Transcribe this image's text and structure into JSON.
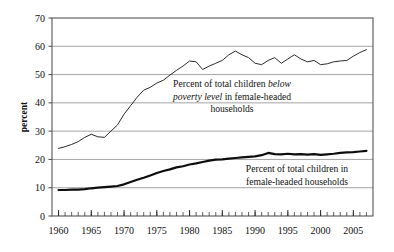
{
  "chart_data": {
    "type": "line",
    "title": "",
    "xlabel": "",
    "ylabel": "percent",
    "xlim": [
      1959,
      2008
    ],
    "ylim": [
      0,
      70
    ],
    "yticks": [
      0,
      10,
      20,
      30,
      40,
      50,
      60,
      70
    ],
    "xticks": [
      1960,
      1965,
      1970,
      1975,
      1980,
      1985,
      1990,
      1995,
      2000,
      2005
    ],
    "xtick_labels": [
      "1960",
      "1965",
      "1970",
      "1975",
      "1980",
      "1985",
      "1990",
      "1995",
      "2000",
      "2005"
    ],
    "ytick_labels": [
      "0",
      "10",
      "20",
      "30",
      "40",
      "50",
      "60",
      "70"
    ],
    "grid": "horizontal",
    "minor_xticks_every": 1,
    "legend_position": "inline-annotations",
    "series": [
      {
        "name": "Percent of total children below poverty level in female-headed households",
        "line_width": 1.0,
        "color": "#2b2b2b",
        "x": [
          1960,
          1961,
          1962,
          1963,
          1964,
          1965,
          1966,
          1967,
          1968,
          1969,
          1970,
          1971,
          1972,
          1973,
          1974,
          1975,
          1976,
          1977,
          1978,
          1979,
          1980,
          1981,
          1982,
          1983,
          1984,
          1985,
          1986,
          1987,
          1988,
          1989,
          1990,
          1991,
          1992,
          1993,
          1994,
          1995,
          1996,
          1997,
          1998,
          1999,
          2000,
          2001,
          2002,
          2003,
          2004,
          2005,
          2006,
          2007
        ],
        "values": [
          23.9,
          24.5,
          25.3,
          26.3,
          27.8,
          28.9,
          28.0,
          27.8,
          30.0,
          32.2,
          36.0,
          39.0,
          42.0,
          44.5,
          45.5,
          47.0,
          48.0,
          49.8,
          51.5,
          53.0,
          54.8,
          54.5,
          51.8,
          53.0,
          54.0,
          55.0,
          57.0,
          58.3,
          57.0,
          56.0,
          54.0,
          53.5,
          55.0,
          56.0,
          54.0,
          55.5,
          57.0,
          55.5,
          54.5,
          55.0,
          53.5,
          53.8,
          54.5,
          54.8,
          55.0,
          56.5,
          57.8,
          58.8
        ]
      },
      {
        "name": "Percent of total children in female-headed households",
        "line_width": 2.2,
        "color": "#0d0d0d",
        "x": [
          1960,
          1961,
          1962,
          1963,
          1964,
          1965,
          1966,
          1967,
          1968,
          1969,
          1970,
          1971,
          1972,
          1973,
          1974,
          1975,
          1976,
          1977,
          1978,
          1979,
          1980,
          1981,
          1982,
          1983,
          1984,
          1985,
          1986,
          1987,
          1988,
          1989,
          1990,
          1991,
          1992,
          1993,
          1994,
          1995,
          1996,
          1997,
          1998,
          1999,
          2000,
          2001,
          2002,
          2003,
          2004,
          2005,
          2006,
          2007
        ],
        "values": [
          9.2,
          9.2,
          9.3,
          9.3,
          9.5,
          9.8,
          10.0,
          10.2,
          10.4,
          10.6,
          11.2,
          12.0,
          12.8,
          13.5,
          14.3,
          15.2,
          15.9,
          16.5,
          17.2,
          17.6,
          18.2,
          18.6,
          19.1,
          19.6,
          19.9,
          20.0,
          20.3,
          20.5,
          20.7,
          20.9,
          21.1,
          21.5,
          22.3,
          21.9,
          21.8,
          22.0,
          21.8,
          21.9,
          21.7,
          21.9,
          21.6,
          21.8,
          22.0,
          22.3,
          22.5,
          22.6,
          22.8,
          23.0
        ]
      }
    ],
    "annotations": [
      {
        "id": "upper-series-annotation",
        "lines": [
          [
            {
              "t": "Percent of total children ",
              "style": "normal"
            },
            {
              "t": "below",
              "style": "italic"
            }
          ],
          [
            {
              "t": "poverty level",
              "style": "italic"
            },
            {
              "t": " in female-headed",
              "style": "normal"
            }
          ],
          [
            {
              "t": "households",
              "style": "normal"
            }
          ]
        ]
      },
      {
        "id": "lower-series-annotation",
        "lines": [
          [
            {
              "t": "Percent of total children in",
              "style": "normal"
            }
          ],
          [
            {
              "t": "female-headed households",
              "style": "normal"
            }
          ]
        ]
      }
    ]
  },
  "style": {
    "background": "#ffffff",
    "grid_color": "#9a9a9a",
    "frame_color": "#555555",
    "text_color": "#111111"
  }
}
